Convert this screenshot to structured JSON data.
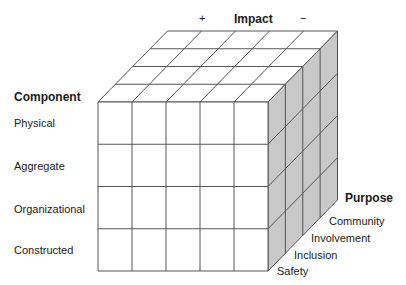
{
  "impact": {
    "title": "Impact",
    "plus": "+",
    "minus": "−"
  },
  "component": {
    "title": "Component",
    "items": [
      "Physical",
      "Aggregate",
      "Organizational",
      "Constructed"
    ]
  },
  "purpose": {
    "title": "Purpose",
    "items": [
      "Community",
      "Involvement",
      "Inclusion",
      "Safety"
    ]
  },
  "cube": {
    "columns": 5,
    "rows": 4,
    "depth": 4,
    "front_face_color": "#ffffff",
    "top_face_color": "#ffffff",
    "side_face_color": "#c8c8c8",
    "line_color": "#555555"
  }
}
